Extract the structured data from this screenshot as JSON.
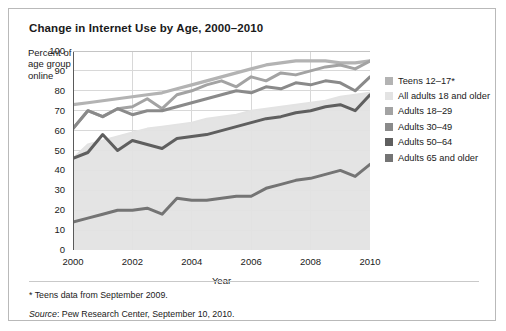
{
  "figure": {
    "title": "Change in Internet Use by Age, 2000–2010",
    "ylabel": "Percent of age group online",
    "xlabel": "Year",
    "footnote": "* Teens data from September 2009.",
    "source_word": "Source",
    "source_rest": ": Pew Research Center, September 10, 2010."
  },
  "legend": {
    "items": [
      {
        "label": "Teens 12–17*",
        "color": "#b3b3b3"
      },
      {
        "label": "All adults 18 and older",
        "color": "#e3e3e3"
      },
      {
        "label": "Adults 18–29",
        "color": "#a3a3a3"
      },
      {
        "label": "Adults 30–49",
        "color": "#8a8a8a"
      },
      {
        "label": "Adults 50–64",
        "color": "#5f5f5f"
      },
      {
        "label": "Adults 65 and older",
        "color": "#747474"
      }
    ]
  },
  "chart_data": {
    "type": "line",
    "title": "Change in Internet Use by Age, 2000–2010",
    "xlabel": "Year",
    "ylabel": "Percent of age group online",
    "xlim": [
      2000,
      2010
    ],
    "ylim": [
      0,
      100
    ],
    "yticks": [
      0,
      10,
      20,
      30,
      40,
      50,
      60,
      70,
      80,
      90,
      100
    ],
    "xticks": [
      2000,
      2002,
      2004,
      2006,
      2008,
      2010
    ],
    "grid": "horizontal-and-vertical",
    "legend_position": "right",
    "x": [
      2000,
      2000.5,
      2001,
      2001.5,
      2002,
      2002.5,
      2003,
      2003.5,
      2004,
      2004.5,
      2005,
      2005.5,
      2006,
      2006.5,
      2007,
      2007.5,
      2008,
      2008.5,
      2009,
      2009.5,
      2010
    ],
    "series": [
      {
        "name": "Teens 12–17*",
        "color": "#b3b3b3",
        "width": 3.2,
        "values": [
          73,
          74,
          75,
          76,
          77,
          78,
          79,
          81,
          83,
          85,
          87,
          89,
          91,
          93,
          94,
          95,
          95,
          95,
          94,
          94,
          95
        ]
      },
      {
        "name": "All adults 18 and older",
        "color": "#e3e3e3",
        "fill": true,
        "width": 2.0,
        "values": [
          46,
          53,
          55,
          57,
          59,
          61,
          62,
          63,
          64,
          66,
          67,
          68,
          70,
          71,
          72,
          73,
          74,
          75,
          77,
          78,
          79
        ]
      },
      {
        "name": "Adults 18–29",
        "color": "#a3a3a3",
        "width": 3.0,
        "values": [
          61,
          70,
          67,
          71,
          72,
          76,
          71,
          78,
          80,
          83,
          85,
          82,
          87,
          85,
          89,
          88,
          90,
          92,
          93,
          91,
          95
        ]
      },
      {
        "name": "Adults 30–49",
        "color": "#8a8a8a",
        "width": 3.0,
        "values": [
          61,
          70,
          67,
          71,
          68,
          70,
          70,
          72,
          74,
          76,
          78,
          80,
          79,
          82,
          81,
          84,
          83,
          85,
          84,
          80,
          87
        ]
      },
      {
        "name": "Adults 50–64",
        "color": "#5f5f5f",
        "width": 3.0,
        "values": [
          46,
          49,
          58,
          50,
          55,
          53,
          51,
          56,
          57,
          58,
          60,
          62,
          64,
          66,
          67,
          69,
          70,
          72,
          73,
          70,
          78
        ]
      },
      {
        "name": "Adults 65 and older",
        "color": "#747474",
        "width": 3.0,
        "values": [
          14,
          16,
          18,
          20,
          20,
          21,
          18,
          26,
          25,
          25,
          26,
          27,
          27,
          31,
          33,
          35,
          36,
          38,
          40,
          37,
          43
        ]
      }
    ]
  }
}
